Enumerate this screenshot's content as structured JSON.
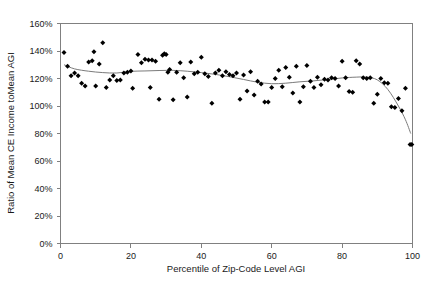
{
  "chart_data": {
    "type": "scatter",
    "title": "",
    "xlabel": "Percentile of Zip-Code Level AGI",
    "ylabel": "Ratio of Mean CE Income toMean AGI",
    "xlim": [
      0,
      100
    ],
    "ylim": [
      0,
      160
    ],
    "grid": false,
    "legend": "none",
    "x_ticks": [
      0,
      20,
      40,
      60,
      80,
      100
    ],
    "x_tick_labels": [
      "0",
      "20",
      "40",
      "60",
      "80",
      "100"
    ],
    "y_ticks": [
      0,
      20,
      40,
      60,
      80,
      100,
      120,
      140,
      160
    ],
    "y_tick_labels": [
      "0%",
      "20%",
      "40%",
      "60%",
      "80%",
      "100%",
      "120%",
      "140%",
      "160%"
    ],
    "y_unit": "percent",
    "marker": "diamond",
    "marker_color": "#000000",
    "trend_color": "#7b7b7b",
    "series": [
      {
        "name": "Ratio of Mean CE Income to Mean AGI by percentile",
        "type": "scatter",
        "points": [
          [
            1,
            139.0
          ],
          [
            2,
            129.0
          ],
          [
            3,
            122.0
          ],
          [
            4,
            124.0
          ],
          [
            5,
            122.0
          ],
          [
            6,
            116.5
          ],
          [
            7,
            114.5
          ],
          [
            8,
            132.0
          ],
          [
            9,
            133.0
          ],
          [
            9.5,
            139.5
          ],
          [
            10,
            114.5
          ],
          [
            11,
            130.5
          ],
          [
            12,
            146.0
          ],
          [
            13,
            113.5
          ],
          [
            14,
            119.0
          ],
          [
            15,
            122.0
          ],
          [
            16,
            118.5
          ],
          [
            17,
            119.0
          ],
          [
            18,
            124.0
          ],
          [
            19,
            124.5
          ],
          [
            20,
            125.5
          ],
          [
            20.5,
            113.0
          ],
          [
            22,
            137.5
          ],
          [
            23,
            131.5
          ],
          [
            24,
            134.0
          ],
          [
            25,
            133.5
          ],
          [
            25.5,
            113.5
          ],
          [
            26,
            133.5
          ],
          [
            27,
            132.5
          ],
          [
            28,
            105.0
          ],
          [
            29,
            137.0
          ],
          [
            29.5,
            138.0
          ],
          [
            30,
            137.5
          ],
          [
            30.5,
            124.5
          ],
          [
            31,
            126.5
          ],
          [
            32,
            104.5
          ],
          [
            33,
            124.5
          ],
          [
            34,
            131.5
          ],
          [
            35,
            120.5
          ],
          [
            36,
            106.5
          ],
          [
            37,
            132.0
          ],
          [
            38,
            123.5
          ],
          [
            39,
            124.5
          ],
          [
            40,
            135.5
          ],
          [
            41,
            123.5
          ],
          [
            42,
            121.5
          ],
          [
            43,
            102.0
          ],
          [
            44,
            124.0
          ],
          [
            45,
            126.0
          ],
          [
            46,
            122.0
          ],
          [
            47,
            125.0
          ],
          [
            48,
            123.0
          ],
          [
            49,
            122.0
          ],
          [
            50,
            124.0
          ],
          [
            51,
            105.0
          ],
          [
            52,
            122.5
          ],
          [
            53,
            111.0
          ],
          [
            54,
            125.0
          ],
          [
            55,
            108.0
          ],
          [
            56,
            118.0
          ],
          [
            57,
            116.0
          ],
          [
            58,
            103.0
          ],
          [
            59,
            103.0
          ],
          [
            60,
            113.5
          ],
          [
            61,
            120.0
          ],
          [
            62,
            126.0
          ],
          [
            63,
            114.0
          ],
          [
            64,
            128.0
          ],
          [
            65,
            121.0
          ],
          [
            66,
            109.5
          ],
          [
            67,
            129.0
          ],
          [
            68,
            103.0
          ],
          [
            69,
            114.0
          ],
          [
            70,
            129.5
          ],
          [
            71,
            118.0
          ],
          [
            72,
            113.5
          ],
          [
            73,
            121.0
          ],
          [
            74,
            115.5
          ],
          [
            75,
            119.5
          ],
          [
            76,
            119.0
          ],
          [
            77,
            120.5
          ],
          [
            78,
            120.0
          ],
          [
            79,
            114.5
          ],
          [
            80,
            132.5
          ],
          [
            81,
            120.5
          ],
          [
            82,
            110.5
          ],
          [
            83,
            110.0
          ],
          [
            84,
            133.0
          ],
          [
            85,
            130.5
          ],
          [
            86,
            120.5
          ],
          [
            87,
            120.0
          ],
          [
            88,
            120.5
          ],
          [
            89,
            102.0
          ],
          [
            90,
            108.5
          ],
          [
            91,
            120.0
          ],
          [
            92,
            117.0
          ],
          [
            93,
            116.5
          ],
          [
            94,
            99.5
          ],
          [
            95,
            99.0
          ],
          [
            96,
            105.5
          ],
          [
            97,
            96.5
          ],
          [
            98,
            113.0
          ],
          [
            99.3,
            72.0
          ],
          [
            99.8,
            72.0
          ]
        ]
      },
      {
        "name": "Smoothed trend",
        "type": "line",
        "points": [
          [
            1,
            130.0
          ],
          [
            4,
            127.0
          ],
          [
            8,
            125.3
          ],
          [
            12,
            124.3
          ],
          [
            16,
            124.0
          ],
          [
            20,
            125.2
          ],
          [
            24,
            125.5
          ],
          [
            28,
            125.8
          ],
          [
            32,
            125.9
          ],
          [
            36,
            125.3
          ],
          [
            40,
            124.3
          ],
          [
            44,
            123.0
          ],
          [
            48,
            121.3
          ],
          [
            52,
            119.3
          ],
          [
            56,
            117.3
          ],
          [
            60,
            116.2
          ],
          [
            64,
            116.6
          ],
          [
            68,
            117.6
          ],
          [
            72,
            118.3
          ],
          [
            76,
            119.3
          ],
          [
            80,
            120.4
          ],
          [
            84,
            121.0
          ],
          [
            87,
            121.0
          ],
          [
            90,
            119.0
          ],
          [
            93,
            112.0
          ],
          [
            96,
            100.0
          ],
          [
            98,
            90.0
          ],
          [
            99.5,
            80.0
          ]
        ]
      }
    ]
  }
}
